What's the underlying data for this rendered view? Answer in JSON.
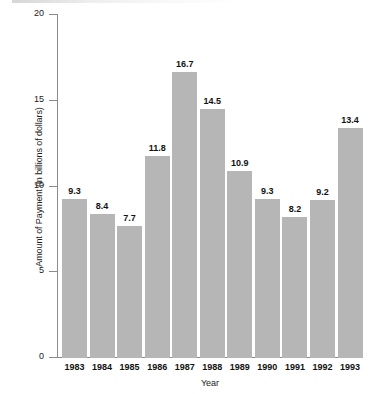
{
  "chart_data": {
    "type": "bar",
    "title": "",
    "xlabel": "Year",
    "ylabel": "Amount of Payment (in billions of dollars)",
    "categories": [
      "1983",
      "1984",
      "1985",
      "1986",
      "1987",
      "1988",
      "1989",
      "1990",
      "1991",
      "1992",
      "1993"
    ],
    "values": [
      9.3,
      8.4,
      7.7,
      11.8,
      16.7,
      14.5,
      10.9,
      9.3,
      8.2,
      9.2,
      13.4
    ],
    "value_labels": [
      "9.3",
      "8.4",
      "7.7",
      "11.8",
      "16.7",
      "14.5",
      "10.9",
      "9.3",
      "8.2",
      "9.2",
      "13.4"
    ],
    "ylim": [
      0,
      20
    ],
    "y_ticks": [
      0,
      5,
      10,
      15,
      20
    ],
    "y_tick_labels": [
      "0",
      "5",
      "10",
      "15",
      "20"
    ],
    "grid": false,
    "legend": false,
    "bar_color": "#b6b6b6",
    "axis_color": "#8c8c8c",
    "text_color": "#111111",
    "background_color": "#ffffff"
  }
}
